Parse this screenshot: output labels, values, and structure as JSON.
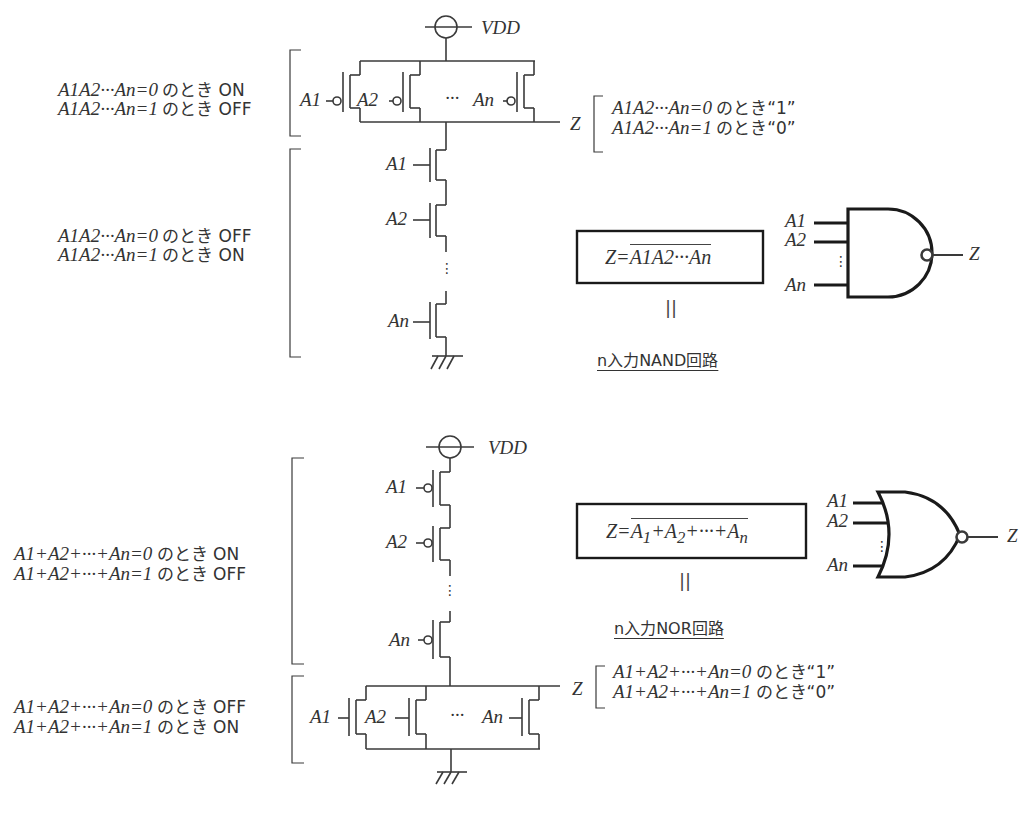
{
  "nand": {
    "vdd_label": "VDD",
    "pmos_note": {
      "line1_expr": "A1A2···An=0",
      "line1_text": "のとき ON",
      "line2_expr": "A1A2···An=1",
      "line2_text": "のとき OFF"
    },
    "nmos_note": {
      "line1_expr": "A1A2···An=0",
      "line1_text": "のとき OFF",
      "line2_expr": "A1A2···An=1",
      "line2_text": "のとき ON"
    },
    "output_label": "Z",
    "output_note": {
      "line1_expr": "A1A2···An=0",
      "line1_text": "のとき“1”",
      "line2_expr": "A1A2···An=1",
      "line2_text": "のとき“0”"
    },
    "pmos_inputs": [
      "A1",
      "A2",
      "···",
      "An"
    ],
    "nmos_inputs": [
      "A1",
      "A2",
      "⋮",
      "An"
    ],
    "formula": "Z = ¬(A1A2···An)",
    "equals_mark": "||",
    "title": "n入力NAND回路",
    "gate_inputs": [
      "A1",
      "A2",
      "⋮",
      "An"
    ],
    "gate_output": "Z"
  },
  "nor": {
    "vdd_label": "VDD",
    "pmos_note": {
      "line1_expr": "A1+A2+···+An=0",
      "line1_text": "のとき ON",
      "line2_expr": "A1+A2+···+An=1",
      "line2_text": "のとき OFF"
    },
    "nmos_note": {
      "line1_expr": "A1+A2+···+An=0",
      "line1_text": "のとき OFF",
      "line2_expr": "A1+A2+···+An=1",
      "line2_text": "のとき ON"
    },
    "output_label": "Z",
    "output_note": {
      "line1_expr": "A1+A2+···+An=0",
      "line1_text": "のとき“1”",
      "line2_expr": "A1+A2+···+An=1",
      "line2_text": "のとき“0”"
    },
    "pmos_inputs": [
      "A1",
      "A2",
      "⋮",
      "An"
    ],
    "nmos_inputs": [
      "A1",
      "A2",
      "···",
      "An"
    ],
    "formula": "Z = ¬(A1+A2+···+An)",
    "equals_mark": "||",
    "title": "n入力NOR回路",
    "gate_inputs": [
      "A1",
      "A2",
      "⋮",
      "An"
    ],
    "gate_output": "Z"
  },
  "colors": {
    "ink": "#333333",
    "gate_stroke": "#1a1a1a",
    "background": "#ffffff"
  }
}
